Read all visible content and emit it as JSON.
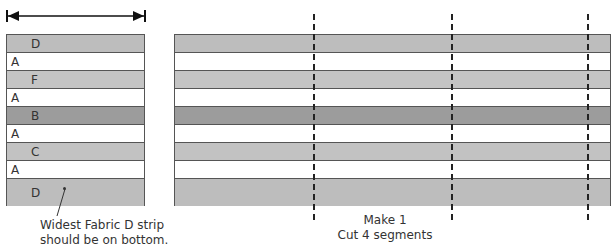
{
  "colors": {
    "D": "#bdbdbd",
    "A": "#ffffff",
    "F": "#c4c4c4",
    "B": "#9c9c9c",
    "C": "#c2c2c2"
  },
  "width_arrow": {
    "label": ""
  },
  "strips": [
    {
      "fabric": "D",
      "label": "D",
      "indent": true,
      "height": 18
    },
    {
      "fabric": "A",
      "label": "A",
      "indent": false,
      "height": 18
    },
    {
      "fabric": "F",
      "label": "F",
      "indent": true,
      "height": 18
    },
    {
      "fabric": "A",
      "label": "A",
      "indent": false,
      "height": 18
    },
    {
      "fabric": "B",
      "label": "B",
      "indent": true,
      "height": 18
    },
    {
      "fabric": "A",
      "label": "A",
      "indent": false,
      "height": 18
    },
    {
      "fabric": "C",
      "label": "C",
      "indent": true,
      "height": 18
    },
    {
      "fabric": "A",
      "label": "A",
      "indent": false,
      "height": 18
    },
    {
      "fabric": "D",
      "label": "D",
      "indent": true,
      "height": 27
    }
  ],
  "callout": {
    "line1": "Widest Fabric D strip",
    "line2": "should be on bottom."
  },
  "instructions": {
    "line1": "Make 1",
    "line2": "Cut 4 segments"
  }
}
